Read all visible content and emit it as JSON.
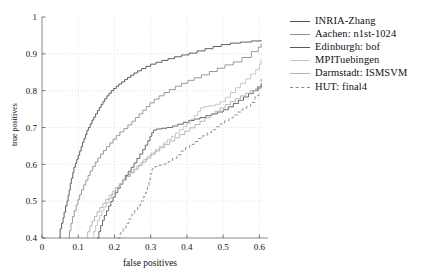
{
  "chart_data": {
    "type": "line",
    "title": "",
    "subtitle": "",
    "xlabel": "false positives",
    "ylabel": "true positives",
    "xlim": [
      0,
      0.61
    ],
    "ylim": [
      0.4,
      1
    ],
    "xticks": [
      0,
      0.1,
      0.2,
      0.3,
      0.4,
      0.5,
      0.6
    ],
    "xticklabels": [
      "0",
      "0.1",
      "0.2",
      "0.3",
      "0.4",
      "0.5",
      "0.6"
    ],
    "yticks": [
      0.4,
      0.5,
      0.6,
      0.7,
      0.8,
      0.9,
      1
    ],
    "yticklabels": [
      "0.4",
      "0.5",
      "0.6",
      "0.7",
      "0.8",
      "0.9",
      "1"
    ],
    "grid": true,
    "grid_style": "dotted",
    "legend_position": "right-outside",
    "series": [
      {
        "name": "INRIA-Zhang",
        "color": "#4d4d4d",
        "dash": "solid",
        "points": [
          [
            0.048,
            0.4
          ],
          [
            0.05,
            0.425
          ],
          [
            0.054,
            0.44
          ],
          [
            0.058,
            0.455
          ],
          [
            0.061,
            0.47
          ],
          [
            0.065,
            0.487
          ],
          [
            0.069,
            0.5
          ],
          [
            0.072,
            0.515
          ],
          [
            0.075,
            0.53
          ],
          [
            0.078,
            0.548
          ],
          [
            0.081,
            0.562
          ],
          [
            0.085,
            0.578
          ],
          [
            0.088,
            0.592
          ],
          [
            0.092,
            0.603
          ],
          [
            0.096,
            0.614
          ],
          [
            0.1,
            0.625
          ],
          [
            0.104,
            0.636
          ],
          [
            0.108,
            0.648
          ],
          [
            0.112,
            0.66
          ],
          [
            0.116,
            0.67
          ],
          [
            0.12,
            0.681
          ],
          [
            0.124,
            0.692
          ],
          [
            0.128,
            0.7
          ],
          [
            0.133,
            0.71
          ],
          [
            0.138,
            0.72
          ],
          [
            0.143,
            0.728
          ],
          [
            0.148,
            0.737
          ],
          [
            0.153,
            0.746
          ],
          [
            0.158,
            0.754
          ],
          [
            0.163,
            0.762
          ],
          [
            0.168,
            0.77
          ],
          [
            0.173,
            0.778
          ],
          [
            0.179,
            0.786
          ],
          [
            0.185,
            0.793
          ],
          [
            0.191,
            0.8
          ],
          [
            0.198,
            0.806
          ],
          [
            0.205,
            0.812
          ],
          [
            0.212,
            0.818
          ],
          [
            0.22,
            0.824
          ],
          [
            0.228,
            0.83
          ],
          [
            0.236,
            0.836
          ],
          [
            0.245,
            0.842
          ],
          [
            0.254,
            0.848
          ],
          [
            0.264,
            0.854
          ],
          [
            0.275,
            0.86
          ],
          [
            0.287,
            0.866
          ],
          [
            0.3,
            0.872
          ],
          [
            0.315,
            0.877
          ],
          [
            0.331,
            0.882
          ],
          [
            0.348,
            0.887
          ],
          [
            0.366,
            0.892
          ],
          [
            0.385,
            0.897
          ],
          [
            0.406,
            0.902
          ],
          [
            0.428,
            0.908
          ],
          [
            0.45,
            0.914
          ],
          [
            0.472,
            0.92
          ],
          [
            0.495,
            0.925
          ],
          [
            0.52,
            0.929
          ],
          [
            0.548,
            0.932
          ],
          [
            0.578,
            0.935
          ],
          [
            0.605,
            0.937
          ]
        ]
      },
      {
        "name": "Aachen: n1st-1024",
        "color": "#909090",
        "dash": "solid",
        "points": [
          [
            0.072,
            0.4
          ],
          [
            0.076,
            0.42
          ],
          [
            0.08,
            0.44
          ],
          [
            0.084,
            0.458
          ],
          [
            0.089,
            0.474
          ],
          [
            0.094,
            0.49
          ],
          [
            0.099,
            0.504
          ],
          [
            0.104,
            0.518
          ],
          [
            0.109,
            0.531
          ],
          [
            0.115,
            0.544
          ],
          [
            0.121,
            0.557
          ],
          [
            0.127,
            0.57
          ],
          [
            0.133,
            0.582
          ],
          [
            0.14,
            0.594
          ],
          [
            0.147,
            0.606
          ],
          [
            0.154,
            0.617
          ],
          [
            0.162,
            0.628
          ],
          [
            0.17,
            0.638
          ],
          [
            0.178,
            0.648
          ],
          [
            0.187,
            0.658
          ],
          [
            0.196,
            0.668
          ],
          [
            0.205,
            0.678
          ],
          [
            0.215,
            0.688
          ],
          [
            0.226,
            0.697
          ],
          [
            0.237,
            0.707
          ],
          [
            0.248,
            0.717
          ],
          [
            0.258,
            0.727
          ],
          [
            0.268,
            0.737
          ],
          [
            0.278,
            0.747
          ],
          [
            0.288,
            0.757
          ],
          [
            0.298,
            0.767
          ],
          [
            0.31,
            0.777
          ],
          [
            0.323,
            0.786
          ],
          [
            0.337,
            0.795
          ],
          [
            0.352,
            0.803
          ],
          [
            0.368,
            0.812
          ],
          [
            0.385,
            0.82
          ],
          [
            0.403,
            0.828
          ],
          [
            0.42,
            0.835
          ],
          [
            0.44,
            0.843
          ],
          [
            0.462,
            0.852
          ],
          [
            0.484,
            0.861
          ],
          [
            0.505,
            0.87
          ],
          [
            0.528,
            0.878
          ],
          [
            0.552,
            0.89
          ],
          [
            0.578,
            0.906
          ],
          [
            0.597,
            0.918
          ],
          [
            0.605,
            0.928
          ]
        ]
      },
      {
        "name": "Edinburgh: bof",
        "color": "#5a5a5a",
        "dash": "solid",
        "points": [
          [
            0.152,
            0.4
          ],
          [
            0.157,
            0.418
          ],
          [
            0.162,
            0.434
          ],
          [
            0.167,
            0.448
          ],
          [
            0.172,
            0.461
          ],
          [
            0.178,
            0.474
          ],
          [
            0.184,
            0.487
          ],
          [
            0.19,
            0.499
          ],
          [
            0.196,
            0.511
          ],
          [
            0.202,
            0.523
          ],
          [
            0.209,
            0.535
          ],
          [
            0.216,
            0.546
          ],
          [
            0.223,
            0.558
          ],
          [
            0.23,
            0.57
          ],
          [
            0.238,
            0.581
          ],
          [
            0.246,
            0.592
          ],
          [
            0.254,
            0.604
          ],
          [
            0.262,
            0.616
          ],
          [
            0.27,
            0.628
          ],
          [
            0.278,
            0.64
          ],
          [
            0.285,
            0.652
          ],
          [
            0.292,
            0.664
          ],
          [
            0.298,
            0.676
          ],
          [
            0.303,
            0.686
          ],
          [
            0.308,
            0.693
          ],
          [
            0.316,
            0.696
          ],
          [
            0.33,
            0.698
          ],
          [
            0.345,
            0.7
          ],
          [
            0.36,
            0.704
          ],
          [
            0.375,
            0.709
          ],
          [
            0.39,
            0.714
          ],
          [
            0.405,
            0.719
          ],
          [
            0.42,
            0.723
          ],
          [
            0.436,
            0.727
          ],
          [
            0.452,
            0.732
          ],
          [
            0.468,
            0.737
          ],
          [
            0.484,
            0.742
          ],
          [
            0.5,
            0.748
          ],
          [
            0.514,
            0.756
          ],
          [
            0.528,
            0.765
          ],
          [
            0.542,
            0.774
          ],
          [
            0.556,
            0.783
          ],
          [
            0.57,
            0.792
          ],
          [
            0.583,
            0.8
          ],
          [
            0.595,
            0.81
          ],
          [
            0.605,
            0.82
          ]
        ]
      },
      {
        "name": "MPITuebingen",
        "color": "#c2c2c2",
        "dash": "solid",
        "points": [
          [
            0.138,
            0.4
          ],
          [
            0.143,
            0.418
          ],
          [
            0.148,
            0.434
          ],
          [
            0.153,
            0.448
          ],
          [
            0.159,
            0.461
          ],
          [
            0.165,
            0.473
          ],
          [
            0.171,
            0.485
          ],
          [
            0.178,
            0.496
          ],
          [
            0.185,
            0.507
          ],
          [
            0.192,
            0.518
          ],
          [
            0.2,
            0.528
          ],
          [
            0.208,
            0.538
          ],
          [
            0.216,
            0.548
          ],
          [
            0.224,
            0.558
          ],
          [
            0.233,
            0.567
          ],
          [
            0.242,
            0.577
          ],
          [
            0.251,
            0.586
          ],
          [
            0.261,
            0.595
          ],
          [
            0.271,
            0.604
          ],
          [
            0.281,
            0.613
          ],
          [
            0.291,
            0.622
          ],
          [
            0.302,
            0.631
          ],
          [
            0.313,
            0.64
          ],
          [
            0.324,
            0.649
          ],
          [
            0.335,
            0.658
          ],
          [
            0.346,
            0.667
          ],
          [
            0.357,
            0.676
          ],
          [
            0.368,
            0.685
          ],
          [
            0.379,
            0.694
          ],
          [
            0.39,
            0.703
          ],
          [
            0.4,
            0.712
          ],
          [
            0.41,
            0.722
          ],
          [
            0.42,
            0.733
          ],
          [
            0.43,
            0.744
          ],
          [
            0.438,
            0.753
          ],
          [
            0.448,
            0.757
          ],
          [
            0.462,
            0.759
          ],
          [
            0.478,
            0.763
          ],
          [
            0.492,
            0.77
          ],
          [
            0.506,
            0.782
          ],
          [
            0.52,
            0.795
          ],
          [
            0.534,
            0.808
          ],
          [
            0.548,
            0.82
          ],
          [
            0.562,
            0.832
          ],
          [
            0.576,
            0.845
          ],
          [
            0.59,
            0.858
          ],
          [
            0.6,
            0.872
          ],
          [
            0.605,
            0.884
          ]
        ]
      },
      {
        "name": "Darmstadt: ISMSVM",
        "color": "#b0b0b0",
        "dash": "solid",
        "points": [
          [
            0.12,
            0.4
          ],
          [
            0.126,
            0.417
          ],
          [
            0.132,
            0.432
          ],
          [
            0.138,
            0.446
          ],
          [
            0.145,
            0.459
          ],
          [
            0.152,
            0.471
          ],
          [
            0.16,
            0.483
          ],
          [
            0.168,
            0.494
          ],
          [
            0.176,
            0.505
          ],
          [
            0.185,
            0.516
          ],
          [
            0.194,
            0.527
          ],
          [
            0.203,
            0.537
          ],
          [
            0.213,
            0.547
          ],
          [
            0.223,
            0.557
          ],
          [
            0.233,
            0.567
          ],
          [
            0.244,
            0.577
          ],
          [
            0.255,
            0.587
          ],
          [
            0.266,
            0.597
          ],
          [
            0.277,
            0.607
          ],
          [
            0.288,
            0.617
          ],
          [
            0.3,
            0.627
          ],
          [
            0.312,
            0.636
          ],
          [
            0.325,
            0.645
          ],
          [
            0.338,
            0.654
          ],
          [
            0.352,
            0.663
          ],
          [
            0.366,
            0.672
          ],
          [
            0.38,
            0.681
          ],
          [
            0.394,
            0.69
          ],
          [
            0.408,
            0.699
          ],
          [
            0.422,
            0.708
          ],
          [
            0.436,
            0.717
          ],
          [
            0.45,
            0.726
          ],
          [
            0.464,
            0.735
          ],
          [
            0.478,
            0.744
          ],
          [
            0.492,
            0.753
          ],
          [
            0.506,
            0.762
          ],
          [
            0.52,
            0.77
          ],
          [
            0.534,
            0.778
          ],
          [
            0.548,
            0.786
          ],
          [
            0.562,
            0.793
          ],
          [
            0.576,
            0.8
          ],
          [
            0.59,
            0.806
          ],
          [
            0.605,
            0.813
          ]
        ]
      },
      {
        "name": "HUT: final4",
        "color": "#8a8a8a",
        "dash": "dashed",
        "points": [
          [
            0.208,
            0.4
          ],
          [
            0.216,
            0.414
          ],
          [
            0.224,
            0.427
          ],
          [
            0.232,
            0.44
          ],
          [
            0.24,
            0.452
          ],
          [
            0.248,
            0.464
          ],
          [
            0.256,
            0.476
          ],
          [
            0.264,
            0.488
          ],
          [
            0.272,
            0.5
          ],
          [
            0.28,
            0.512
          ],
          [
            0.286,
            0.524
          ],
          [
            0.291,
            0.54
          ],
          [
            0.295,
            0.558
          ],
          [
            0.299,
            0.575
          ],
          [
            0.304,
            0.588
          ],
          [
            0.312,
            0.594
          ],
          [
            0.324,
            0.598
          ],
          [
            0.336,
            0.601
          ],
          [
            0.348,
            0.607
          ],
          [
            0.36,
            0.616
          ],
          [
            0.372,
            0.626
          ],
          [
            0.384,
            0.636
          ],
          [
            0.396,
            0.645
          ],
          [
            0.408,
            0.654
          ],
          [
            0.42,
            0.662
          ],
          [
            0.432,
            0.67
          ],
          [
            0.444,
            0.678
          ],
          [
            0.456,
            0.686
          ],
          [
            0.468,
            0.694
          ],
          [
            0.48,
            0.702
          ],
          [
            0.492,
            0.71
          ],
          [
            0.504,
            0.718
          ],
          [
            0.516,
            0.726
          ],
          [
            0.528,
            0.734
          ],
          [
            0.54,
            0.742
          ],
          [
            0.552,
            0.75
          ],
          [
            0.564,
            0.756
          ],
          [
            0.576,
            0.768
          ],
          [
            0.588,
            0.786
          ],
          [
            0.598,
            0.808
          ],
          [
            0.605,
            0.832
          ]
        ]
      }
    ]
  },
  "legend": {
    "entries": [
      {
        "label": "INRIA-Zhang"
      },
      {
        "label": "Aachen: n1st-1024"
      },
      {
        "label": "Edinburgh: bof"
      },
      {
        "label": "MPITuebingen"
      },
      {
        "label": "Darmstadt: ISMSVM"
      },
      {
        "label": "HUT: final4"
      }
    ]
  }
}
